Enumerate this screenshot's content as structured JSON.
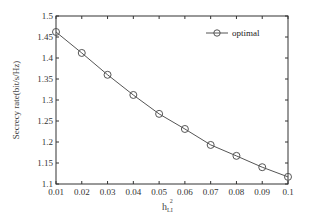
{
  "chart_data": {
    "type": "line",
    "title": "",
    "xlabel": "h_LI^2",
    "xlabel_base": "h",
    "xlabel_sub": "LI",
    "xlabel_sup": "2",
    "ylabel": "Secrecy rate(bit/s/Hz)",
    "xlim": [
      0.01,
      0.1
    ],
    "ylim": [
      1.1,
      1.5
    ],
    "xticks": [
      0.01,
      0.02,
      0.03,
      0.04,
      0.05,
      0.06,
      0.07,
      0.08,
      0.09,
      0.1
    ],
    "xtick_labels": [
      "0.01",
      "0.02",
      "0.03",
      "0.04",
      "0.05",
      "0.06",
      "0.07",
      "0.08",
      "0.09",
      "0.1"
    ],
    "yticks": [
      1.1,
      1.15,
      1.2,
      1.25,
      1.3,
      1.35,
      1.4,
      1.45,
      1.5
    ],
    "ytick_labels": [
      "1.1",
      "1.15",
      "1.2",
      "1.25",
      "1.3",
      "1.35",
      "1.4",
      "1.45",
      "1.5"
    ],
    "grid": false,
    "box": true,
    "legend_position": "top-right",
    "x": [
      0.01,
      0.02,
      0.03,
      0.04,
      0.05,
      0.06,
      0.07,
      0.08,
      0.09,
      0.1
    ],
    "series": [
      {
        "name": "optimal",
        "marker": "circle",
        "color": "#555555",
        "values": [
          1.462,
          1.412,
          1.36,
          1.312,
          1.267,
          1.231,
          1.193,
          1.167,
          1.14,
          1.117
        ]
      }
    ]
  },
  "legend": {
    "items": [
      {
        "label": "optimal"
      }
    ]
  }
}
